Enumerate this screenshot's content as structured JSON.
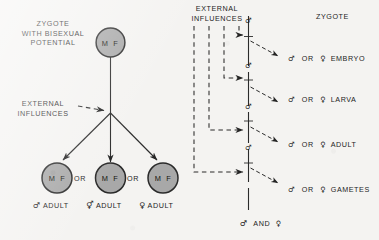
{
  "figure": {
    "background_color": "#f4f3f1",
    "ink_color": "#1d1d1d",
    "circle_fill": "#a8a8a8",
    "circle_stroke": "#2a2a2a"
  },
  "left_panel": {
    "zygote_caption": "ZYGOTE\nWITH BISEXUAL\nPOTENTIAL",
    "zygote_caption_lines": [
      "ZYGOTE",
      "WITH BISEXUAL",
      "POTENTIAL"
    ],
    "external_caption_lines": [
      "EXTERNAL",
      "INFLUENCES"
    ],
    "zygote_circle": {
      "male_symbol_letter": "M",
      "female_symbol_letter": "F"
    },
    "outcomes": [
      {
        "circle": {
          "male_symbol_letter": "M",
          "female_symbol_letter": "F"
        },
        "sex_symbol": "♂",
        "label": "ADULT",
        "connector": ""
      },
      {
        "circle": {
          "male_symbol_letter": "M",
          "female_symbol_letter": "F"
        },
        "sex_symbol": "⚥",
        "label": "ADULT",
        "connector": "OR"
      },
      {
        "circle": {
          "male_symbol_letter": "M",
          "female_symbol_letter": "F"
        },
        "sex_symbol": "♀",
        "label": "ADULT",
        "connector": "OR"
      }
    ]
  },
  "right_panel": {
    "external_caption_lines": [
      "EXTERNAL",
      "INFLUENCES"
    ],
    "stage_header": "ZYGOTE",
    "bottom_note": {
      "male_symbol": "♂",
      "conjunction": "AND",
      "female_symbol": "♀"
    },
    "axis_symbol": "♂",
    "stages": [
      {
        "male_symbol": "♂",
        "connector": "OR",
        "female_symbol": "♀",
        "label": "EMBRYO"
      },
      {
        "male_symbol": "♂",
        "connector": "OR",
        "female_symbol": "♀",
        "label": "LARVA"
      },
      {
        "male_symbol": "♂",
        "connector": "OR",
        "female_symbol": "♀",
        "label": "ADULT"
      },
      {
        "male_symbol": "♂",
        "connector": "OR",
        "female_symbol": "♀",
        "label": "GAMETES"
      }
    ]
  }
}
